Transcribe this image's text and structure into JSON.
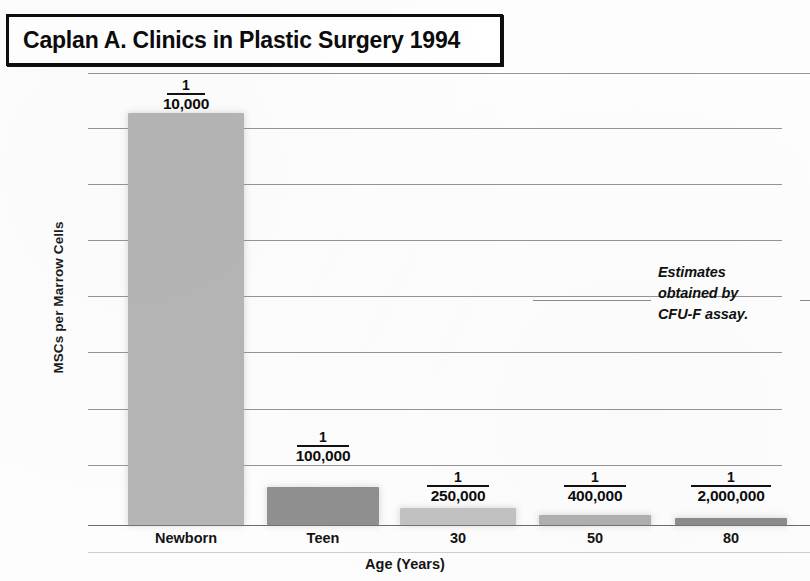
{
  "title": {
    "text": "Caplan A. Clinics in Plastic Surgery 1994"
  },
  "annotation": {
    "line1": "Estimates",
    "line2": "obtained by",
    "line3": "CFU-F assay."
  },
  "axes": {
    "ylabel": "MSCs per Marrow Cells",
    "xlabel": "Age (Years)"
  },
  "chart_data": {
    "type": "bar",
    "title": "Caplan A. Clinics in Plastic Surgery 1994",
    "subtitle": "",
    "xlabel": "Age (Years)",
    "ylabel": "MSCs per Marrow Cells",
    "categories": [
      "Newborn",
      "Teen",
      "30",
      "50",
      "80"
    ],
    "point_labels": [
      "1/10,000",
      "1/100,000",
      "1/250,000",
      "1/400,000",
      "1/2,000,000"
    ],
    "numerators": [
      "1",
      "1",
      "1",
      "1",
      "1"
    ],
    "denominators": [
      "10,000",
      "100,000",
      "250,000",
      "400,000",
      "2,000,000"
    ],
    "values": [
      0.0001,
      1e-05,
      4e-06,
      2.5e-06,
      5e-07
    ],
    "bar_pixel_heights": [
      412,
      38,
      17,
      10,
      7
    ],
    "bar_colors": [
      "#b5b5b5",
      "#8f8f8f",
      "#c2c2c2",
      "#b0b0b0",
      "#8b8b8b"
    ],
    "grid": true,
    "gridline_count": 9,
    "legend": "none",
    "annotation": "Estimates obtained by CFU-F assay.",
    "ylim_note": "linear axis, top gridline near 1/10,000"
  },
  "bars": [
    {
      "label": "Newborn",
      "frac_num": "1",
      "frac_den": "10,000",
      "left": 128,
      "width": 116,
      "top": 113,
      "height": 412,
      "color": "#b5b5b5",
      "label_top": 78,
      "label_left": 128,
      "label_width": 116,
      "line_w": 38
    },
    {
      "label": "Teen",
      "frac_num": "1",
      "frac_den": "100,000",
      "left": 267,
      "width": 112,
      "top": 487,
      "height": 38,
      "color": "#8f8f8f",
      "label_top": 430,
      "label_left": 267,
      "label_width": 112,
      "line_w": 52
    },
    {
      "label": "30",
      "frac_num": "1",
      "frac_den": "250,000",
      "left": 400,
      "width": 116,
      "top": 508,
      "height": 17,
      "color": "#c2c2c2",
      "label_top": 470,
      "label_left": 400,
      "label_width": 116,
      "line_w": 62
    },
    {
      "label": "50",
      "frac_num": "1",
      "frac_den": "400,000",
      "left": 539,
      "width": 112,
      "top": 515,
      "height": 10,
      "color": "#b0b0b0",
      "label_top": 470,
      "label_left": 539,
      "label_width": 112,
      "line_w": 62
    },
    {
      "label": "80",
      "frac_num": "1",
      "frac_den": "2,000,000",
      "left": 675,
      "width": 112,
      "top": 518,
      "height": 7,
      "color": "#8b8b8b",
      "label_top": 470,
      "label_left": 669,
      "label_width": 124,
      "line_w": 80
    }
  ],
  "gridlines": [
    73,
    128,
    184,
    240,
    296,
    352,
    409,
    465,
    525
  ],
  "categories_pos": [
    {
      "label": "Newborn",
      "left": 110,
      "width": 152
    },
    {
      "label": "Teen",
      "left": 257,
      "width": 132
    },
    {
      "label": "30",
      "left": 400,
      "width": 116
    },
    {
      "label": "50",
      "left": 539,
      "width": 112
    },
    {
      "label": "80",
      "left": 675,
      "width": 112
    }
  ]
}
